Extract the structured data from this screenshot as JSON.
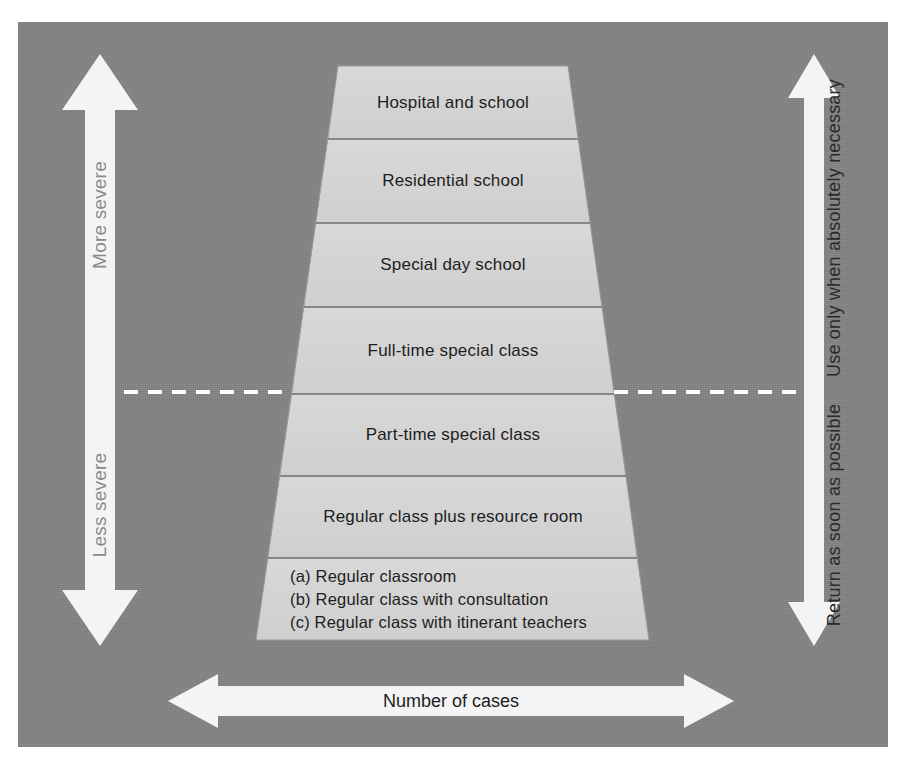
{
  "figure": {
    "panel_color": "#848484",
    "band_fill": "#d4d4d4",
    "band_stroke": "#6e6e6e",
    "arrow_fill": "#f4f4f4"
  },
  "pyramid": {
    "bands": [
      {
        "id": "hospital-and-school",
        "label": "Hospital and school"
      },
      {
        "id": "residential-school",
        "label": "Residential school"
      },
      {
        "id": "special-day-school",
        "label": "Special day school"
      },
      {
        "id": "full-time-special-class",
        "label": "Full-time special class"
      },
      {
        "id": "part-time-special-class",
        "label": "Part-time special class"
      },
      {
        "id": "regular-class-resource-room",
        "label": "Regular class plus resource room"
      },
      {
        "id": "regular-class-options",
        "label": "(a) Regular classroom\n(b) Regular class with consultation\n(c) Regular class with itinerant teachers"
      }
    ]
  },
  "severity_axis": {
    "icon": "double-headed-vertical-arrow-icon",
    "top_label": "More severe",
    "bottom_label": "Less severe"
  },
  "usage_axis": {
    "icon": "double-headed-vertical-arrow-icon",
    "top_label": "Use only when absolutely necessary",
    "bottom_label": "Return as soon as possible"
  },
  "cases_axis": {
    "icon": "double-headed-horizontal-arrow-icon",
    "label": "Number of cases"
  },
  "divider": {
    "name": "severity-threshold-dashed-line",
    "style": "dashed",
    "color": "#ffffff"
  }
}
